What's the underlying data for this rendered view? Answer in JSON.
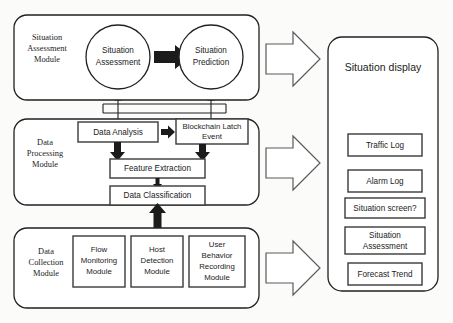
{
  "diagram": {
    "background": "#fbfbfa",
    "stroke_color": "#231f20",
    "arrow_fill": "#1b1b1b",
    "modules": [
      {
        "id": "situation-assessment-module",
        "label_lines": [
          "Situation",
          "Assessment",
          "Module"
        ],
        "nodes": [
          {
            "id": "situation-assessment",
            "shape": "circle",
            "label_lines": [
              "Situation",
              "Assessment"
            ]
          },
          {
            "id": "situation-prediction",
            "shape": "circle",
            "label_lines": [
              "Situation",
              "Prediction"
            ]
          }
        ]
      },
      {
        "id": "data-processing-module",
        "label_lines": [
          "Data",
          "Processing",
          "Module"
        ],
        "nodes": [
          {
            "id": "data-analysis",
            "shape": "box",
            "label_lines": [
              "Data Analysis"
            ]
          },
          {
            "id": "blockchain-latch-event",
            "shape": "box",
            "label_lines": [
              "Blockchain Latch",
              "Event"
            ]
          },
          {
            "id": "feature-extraction",
            "shape": "box",
            "label_lines": [
              "Feature Extraction"
            ]
          },
          {
            "id": "data-classification",
            "shape": "box",
            "label_lines": [
              "Data Classification"
            ]
          }
        ]
      },
      {
        "id": "data-collection-module",
        "label_lines": [
          "Data",
          "Collection",
          "Module"
        ],
        "nodes": [
          {
            "id": "flow-monitoring-module",
            "shape": "box",
            "label_lines": [
              "Flow",
              "Monitoring",
              "Module"
            ]
          },
          {
            "id": "host-detection-module",
            "shape": "box",
            "label_lines": [
              "Host",
              "Detection",
              "Module"
            ]
          },
          {
            "id": "user-behavior-recording-module",
            "shape": "box",
            "label_lines": [
              "User",
              "Behavior",
              "Recording",
              "Module"
            ]
          }
        ]
      }
    ],
    "display_panel": {
      "id": "situation-display-panel",
      "title": "Situation display",
      "items": [
        {
          "id": "traffic-log",
          "label": "Traffic Log"
        },
        {
          "id": "alarm-log",
          "label": "Alarm Log"
        },
        {
          "id": "situation-screen",
          "label": "Situation screen?"
        },
        {
          "id": "situation-assessment-item",
          "label_lines": [
            "Situation",
            "Assessment"
          ]
        },
        {
          "id": "forecast-trend",
          "label": "Forecast Trend"
        }
      ]
    },
    "block_arrows": [
      {
        "id": "block-arrow-assessment-to-display",
        "direction": "right"
      },
      {
        "id": "block-arrow-processing-to-display",
        "direction": "right"
      },
      {
        "id": "block-arrow-collection-to-display",
        "direction": "right"
      }
    ],
    "flow_arrows": [
      {
        "id": "arrow-assessment-to-prediction",
        "direction": "right"
      },
      {
        "id": "arrow-analysis-to-blockchain",
        "direction": "right"
      },
      {
        "id": "arrow-feature-to-analysis",
        "direction": "up"
      },
      {
        "id": "arrow-feature-to-blockchain",
        "direction": "up"
      },
      {
        "id": "arrow-classification-to-feature",
        "direction": "up"
      },
      {
        "id": "arrow-collection-to-classification",
        "direction": "up"
      }
    ],
    "connectors": [
      {
        "id": "connector-analysis-to-assessment",
        "direction": "up"
      },
      {
        "id": "connector-blockchain-to-prediction",
        "direction": "up"
      }
    ]
  }
}
